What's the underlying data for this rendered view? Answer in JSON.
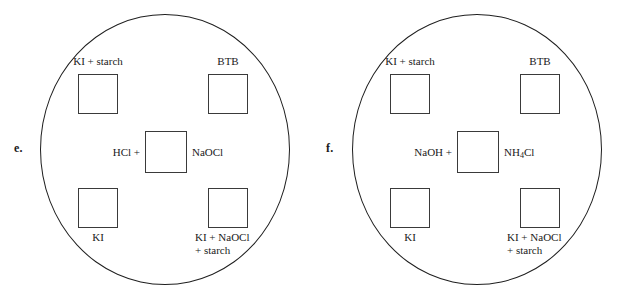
{
  "figure": {
    "type": "petri-dish-diagram",
    "panels": [
      {
        "letter": "e.",
        "wells": {
          "top_left": {
            "label": "KI + starch"
          },
          "top_right": {
            "label": "BTB"
          },
          "center_left": {
            "label": "HCl +"
          },
          "center_right": {
            "label": "NaOCl"
          },
          "bottom_left": {
            "label": "KI"
          },
          "bottom_right": {
            "label_line1": "KI + NaOCl",
            "label_line2": "+ starch"
          }
        }
      },
      {
        "letter": "f.",
        "wells": {
          "top_left": {
            "label": "KI + starch"
          },
          "top_right": {
            "label": "BTB"
          },
          "center_left": {
            "label": "NaOH +"
          },
          "center_right_pre": "NH",
          "center_right_sub": "4",
          "center_right_post": "Cl",
          "bottom_left": {
            "label": "KI"
          },
          "bottom_right": {
            "label_line1": "KI + NaOCl",
            "label_line2": "+ starch"
          }
        }
      }
    ],
    "colors": {
      "stroke": "#1f1f1f",
      "well_stroke": "#3a3a3a",
      "background": "#ffffff",
      "text": "#1a1a1a"
    }
  }
}
